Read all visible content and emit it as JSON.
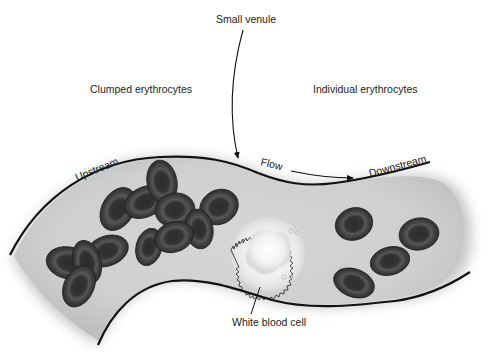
{
  "diagram": {
    "labels": {
      "small_venule": "Small venule",
      "clumped": "Clumped erythrocytes",
      "individual": "Individual erythrocytes",
      "upstream": "Upstream",
      "flow": "Flow",
      "downstream": "Downstream",
      "wbc": "White blood cell"
    },
    "colors": {
      "background": "#ffffff",
      "vessel_fill": "#d4d4d4",
      "vessel_wall": "#111111",
      "rbc_outer": "#3a3a3a",
      "rbc_inner": "#2a2a2a",
      "wbc_fill": "#f6f6f6",
      "text": "#222222"
    },
    "elements": {
      "clumped_erythrocytes_count": 13,
      "individual_erythrocytes_count": 4,
      "white_blood_cells_count": 1
    }
  }
}
